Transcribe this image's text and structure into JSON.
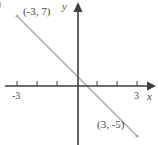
{
  "figure": {
    "background": "#ffffff",
    "corner_fragment": ")",
    "labels": {
      "point_a": "(-3, 7)",
      "point_b": "(3, -5)",
      "x_axis": "x",
      "y_axis": "y",
      "tick_neg3": "-3",
      "tick_3": "3"
    }
  },
  "colors": {
    "axis": "#3f3f3f",
    "line": "#a9a9a9",
    "text": "#4a4a4a",
    "fragment": "#9f9f9f"
  },
  "chart_data": {
    "type": "line",
    "title": "",
    "xlabel": "x",
    "ylabel": "y",
    "points": [
      {
        "x": -3,
        "y": 7,
        "label": "(-3, 7)"
      },
      {
        "x": 3,
        "y": -5,
        "label": "(3, -5)"
      }
    ],
    "series": [
      {
        "name": "segment-through-points",
        "x": [
          -3,
          3
        ],
        "y": [
          7,
          -5
        ]
      }
    ],
    "slope": -2,
    "y_intercept": 1,
    "x_intercept": 0.5,
    "x_ticks": [
      -3,
      -2,
      -1,
      1,
      2,
      3
    ],
    "x_tick_labels_shown": [
      "-3",
      "3"
    ],
    "xlim": [
      -3.6,
      4.0
    ],
    "ylim": [
      -6.0,
      8.3
    ],
    "grid": false,
    "legend": false
  }
}
